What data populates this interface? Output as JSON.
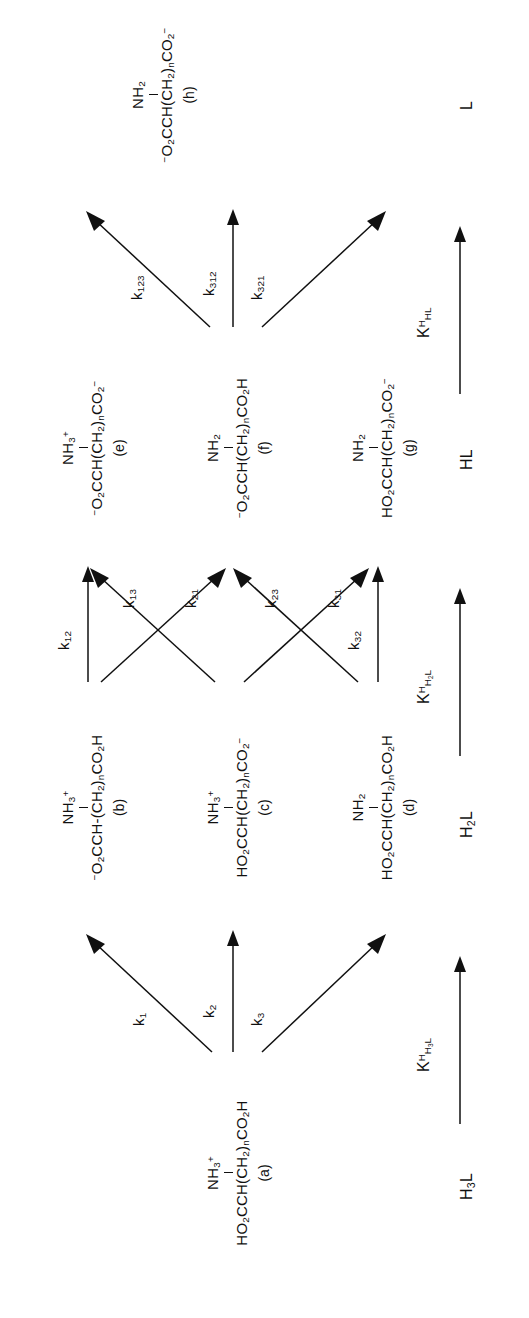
{
  "figure": {
    "type": "chemical-equilibrium-scheme",
    "orientation": "rotated-90-ccw"
  },
  "species": {
    "a": {
      "id": "a",
      "tag": "(a)",
      "amine": "NH",
      "amine_sub": "3",
      "amine_charge": "+",
      "backbone_pre": "HO",
      "backbone_pre_sub": "2",
      "backbone_mid": "CCH(CH",
      "backbone_mid_sub": "2",
      "backbone_close": ")",
      "backbone_n": "n",
      "backbone_end": "CO",
      "backbone_end_sub": "2",
      "backbone_term": "H",
      "backbone_term_charge": "",
      "full": "HO2CCH(CH2)nCO2H with NH3+",
      "class": "H3L"
    },
    "b": {
      "id": "b",
      "tag": "(b)",
      "amine": "NH",
      "amine_sub": "3",
      "amine_charge": "+",
      "backbone_pre": "",
      "backbone_pre_sub": "",
      "backbone_mid": "O",
      "backbone_mid_sub": "2",
      "backbone_close": "CCH-(CH",
      "backbone_n": "2",
      "backbone_end": ")",
      "backbone_end_sub": "n",
      "backbone_term": "CO",
      "backbone_term_sub": "2",
      "backbone_term_h": "H",
      "leading_charge": "-",
      "full": "-O2CCH-(CH2)nCO2H with NH3+",
      "class": "H2L"
    },
    "c": {
      "id": "c",
      "tag": "(c)",
      "amine": "NH",
      "amine_sub": "3",
      "amine_charge": "+",
      "full": "HO2CCH(CH2)nCO2- with NH3+",
      "class": "H2L"
    },
    "d": {
      "id": "d",
      "tag": "(d)",
      "amine": "NH",
      "amine_sub": "2",
      "amine_charge": "",
      "full": "HO2CCH(CH2)nCO2H with NH2",
      "class": "H2L"
    },
    "e": {
      "id": "e",
      "tag": "(e)",
      "amine": "NH",
      "amine_sub": "3",
      "amine_charge": "+",
      "full": "-O2CCH(CH2)nCO2- with NH3+",
      "class": "HL"
    },
    "f": {
      "id": "f",
      "tag": "(f)",
      "amine": "NH",
      "amine_sub": "2",
      "amine_charge": "",
      "full": "-O2CCH(CH2)nCO2H with NH2",
      "class": "HL"
    },
    "g": {
      "id": "g",
      "tag": "(g)",
      "amine": "NH",
      "amine_sub": "2",
      "amine_charge": "",
      "full": "HO2CCH(CH2)nCO2- with NH2",
      "class": "HL"
    },
    "h": {
      "id": "h",
      "tag": "(h)",
      "amine": "NH",
      "amine_sub": "2",
      "amine_charge": "",
      "full": "-O2CCH(CH2)nCO2- with NH2",
      "class": "L"
    }
  },
  "rate_constants": [
    {
      "id": "k1",
      "base": "k",
      "sub": "1",
      "from": "a",
      "to": "b"
    },
    {
      "id": "k2",
      "base": "k",
      "sub": "2",
      "from": "a",
      "to": "c"
    },
    {
      "id": "k3",
      "base": "k",
      "sub": "3",
      "from": "a",
      "to": "d"
    },
    {
      "id": "k12",
      "base": "k",
      "sub": "12",
      "from": "b",
      "to": "e"
    },
    {
      "id": "k13",
      "base": "k",
      "sub": "13",
      "from": "b",
      "to": "f"
    },
    {
      "id": "k21",
      "base": "k",
      "sub": "21",
      "from": "c",
      "to": "e"
    },
    {
      "id": "k23",
      "base": "k",
      "sub": "23",
      "from": "c",
      "to": "g"
    },
    {
      "id": "k31",
      "base": "k",
      "sub": "31",
      "from": "d",
      "to": "f"
    },
    {
      "id": "k32",
      "base": "k",
      "sub": "32",
      "from": "d",
      "to": "g"
    },
    {
      "id": "k123",
      "base": "k",
      "sub": "123",
      "from": "e",
      "to": "h"
    },
    {
      "id": "k312",
      "base": "k",
      "sub": "312",
      "from": "f",
      "to": "h"
    },
    {
      "id": "k321",
      "base": "k",
      "sub": "321",
      "from": "g",
      "to": "h"
    }
  ],
  "classes": [
    {
      "id": "H3L",
      "base": "H",
      "sub": "3",
      "tail": "L"
    },
    {
      "id": "H2L",
      "base": "H",
      "sub": "2",
      "tail": "L"
    },
    {
      "id": "HL",
      "base": "H",
      "sub": "",
      "tail": "L"
    },
    {
      "id": "L",
      "base": "",
      "sub": "",
      "tail": "L"
    }
  ],
  "equilibrium_constants": [
    {
      "id": "KH3L",
      "base": "K",
      "sup": "H",
      "sub": "H",
      "sub2": "3",
      "sub3": "L",
      "between": "H3L->H2L"
    },
    {
      "id": "KH2L",
      "base": "K",
      "sup": "H",
      "sub": "H",
      "sub2": "2",
      "sub3": "L",
      "between": "H2L->HL"
    },
    {
      "id": "KHL",
      "base": "K",
      "sup": "H",
      "sub": "H",
      "sub2": "",
      "sub3": "L",
      "between": "HL->L"
    }
  ],
  "colors": {
    "ink": "#101010",
    "paper": "#ffffff"
  }
}
